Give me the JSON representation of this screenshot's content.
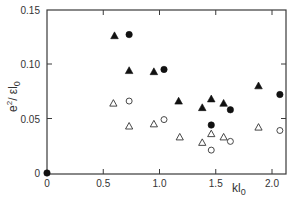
{
  "chart_data": {
    "type": "scatter",
    "title": "",
    "xlabel": "kl0",
    "xlabel_display": {
      "main": "kl",
      "sub": "0"
    },
    "ylabel": "e^2/εl0",
    "ylabel_display": {
      "main": "e",
      "sup": "2",
      "rest": "/ εl",
      "sub": "0"
    },
    "xlim": [
      0,
      2.1
    ],
    "ylim": [
      0,
      0.15
    ],
    "x_ticks": [
      0,
      0.5,
      1.0,
      1.5,
      2.0
    ],
    "x_tick_labels": [
      "0",
      "0.5",
      "1.0",
      "1.5",
      "2.0"
    ],
    "y_ticks": [
      0,
      0.05,
      0.1,
      0.15
    ],
    "y_tick_labels": [
      "0",
      "0.05",
      "0.10",
      "0.15"
    ],
    "grid": false,
    "legend": null,
    "series": [
      {
        "name": "filled triangles",
        "marker": "triangle-filled",
        "points": [
          [
            0.6,
            0.126
          ],
          [
            0.73,
            0.094
          ],
          [
            0.95,
            0.093
          ],
          [
            1.17,
            0.066
          ],
          [
            1.38,
            0.06
          ],
          [
            1.46,
            0.068
          ],
          [
            1.57,
            0.064
          ],
          [
            1.88,
            0.08
          ]
        ]
      },
      {
        "name": "filled circles",
        "marker": "circle-filled",
        "points": [
          [
            0.0,
            0.0
          ],
          [
            0.73,
            0.127
          ],
          [
            1.04,
            0.095
          ],
          [
            1.46,
            0.044
          ],
          [
            1.63,
            0.058
          ],
          [
            2.07,
            0.072
          ]
        ]
      },
      {
        "name": "open triangles",
        "marker": "triangle-open",
        "points": [
          [
            0.59,
            0.064
          ],
          [
            0.73,
            0.043
          ],
          [
            0.95,
            0.045
          ],
          [
            1.18,
            0.033
          ],
          [
            1.38,
            0.028
          ],
          [
            1.46,
            0.036
          ],
          [
            1.57,
            0.033
          ],
          [
            1.88,
            0.042
          ]
        ]
      },
      {
        "name": "open circles",
        "marker": "circle-open",
        "points": [
          [
            0.73,
            0.066
          ],
          [
            1.04,
            0.049
          ],
          [
            1.46,
            0.021
          ],
          [
            1.63,
            0.029
          ],
          [
            2.07,
            0.039
          ]
        ]
      }
    ]
  }
}
